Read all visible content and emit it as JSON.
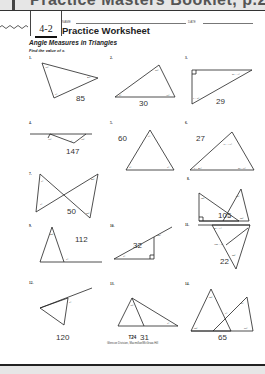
{
  "header": {
    "booklet_title": "Practice Masters Booklet, p.24",
    "lesson_number": "4-2",
    "name_label": "NAME",
    "date_label": "DATE",
    "worksheet_title": "Practice Worksheet",
    "subtitle": "Angle Measures in Triangles",
    "instructions": "Find the value of x."
  },
  "problems": [
    {
      "number": "1.",
      "labels": [
        "35°",
        "45°",
        "x°"
      ],
      "answer": "85"
    },
    {
      "number": "2.",
      "labels": [
        "55°",
        "x°",
        "3x°"
      ],
      "answer": "30"
    },
    {
      "number": "3.",
      "labels": [
        "2x − 3°",
        "x + 5°"
      ],
      "answer": "29"
    },
    {
      "number": "4.",
      "labels": [
        "15°",
        "x°",
        "18°"
      ],
      "answer": "147"
    },
    {
      "number": "5.",
      "labels": [
        "x°",
        "x°",
        "x°"
      ],
      "answer": "60"
    },
    {
      "number": "6.",
      "labels": [
        "3x − 17°",
        "x + 46°",
        "2x − 5°"
      ],
      "answer": "27"
    },
    {
      "number": "7.",
      "labels": [
        "x°",
        "x°",
        "40°",
        "80°"
      ],
      "answer": "50"
    },
    {
      "number": "8.",
      "labels": [
        "50°",
        "55°",
        "80°",
        "x°"
      ],
      "answer": "105"
    },
    {
      "number": "9.",
      "labels": [
        "44°",
        "x°"
      ],
      "answer": "112"
    },
    {
      "number": "10.",
      "labels": [
        "122°",
        "x°"
      ],
      "answer": "32"
    },
    {
      "number": "11.",
      "labels": [
        "4x − 7°",
        "100 − x°",
        "24°"
      ],
      "answer": "22"
    },
    {
      "number": "12.",
      "labels": [
        "x°"
      ],
      "answer": "120"
    },
    {
      "number": "13.",
      "labels": [
        "38°",
        "x°"
      ],
      "answer": "31"
    },
    {
      "number": "14.",
      "labels": [
        "50°",
        "55°",
        "x°",
        "60°",
        "65°"
      ],
      "answer": "65"
    }
  ],
  "footer": {
    "page_number": "T24",
    "credit": "Glencoe Division, Macmillan/McGraw-Hill"
  }
}
